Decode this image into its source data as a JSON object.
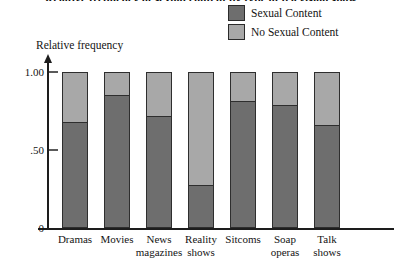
{
  "chart_data": {
    "type": "bar",
    "subtype": "stacked-bar-100-percent",
    "title": "Relative frequency of sexual content by type of television show",
    "xlabel": "",
    "ylabel": "Relative frequency",
    "ylim": [
      0,
      1.0
    ],
    "ytick_labels": [
      "1.00",
      ".50",
      "0"
    ],
    "ytick_values": [
      1.0,
      0.5,
      0
    ],
    "grid": false,
    "legend_position": "top-right",
    "categories": [
      "Dramas",
      "Movies",
      "News magazines",
      "Reality shows",
      "Sitcoms",
      "Soap operas",
      "Talk shows"
    ],
    "category_lines": [
      [
        "Dramas"
      ],
      [
        "Movies"
      ],
      [
        "News",
        "magazines"
      ],
      [
        "Reality",
        "shows"
      ],
      [
        "Sitcoms"
      ],
      [
        "Soap",
        "operas"
      ],
      [
        "Talk",
        "shows"
      ]
    ],
    "series": [
      {
        "name": "Sexual Content",
        "color": "#6e6e6e",
        "values": [
          0.68,
          0.86,
          0.72,
          0.27,
          0.82,
          0.79,
          0.66
        ]
      },
      {
        "name": "No Sexual Content",
        "color": "#a8a8a8",
        "values": [
          0.32,
          0.14,
          0.28,
          0.73,
          0.18,
          0.21,
          0.34
        ]
      }
    ]
  },
  "legend": {
    "items": [
      {
        "label": "Sexual Content",
        "color": "#6e6e6e"
      },
      {
        "label": "No Sexual Content",
        "color": "#a8a8a8"
      }
    ]
  },
  "axis": {
    "y_label": "Relative frequency",
    "y_ticks": [
      "1.00",
      ".50",
      "0"
    ]
  }
}
